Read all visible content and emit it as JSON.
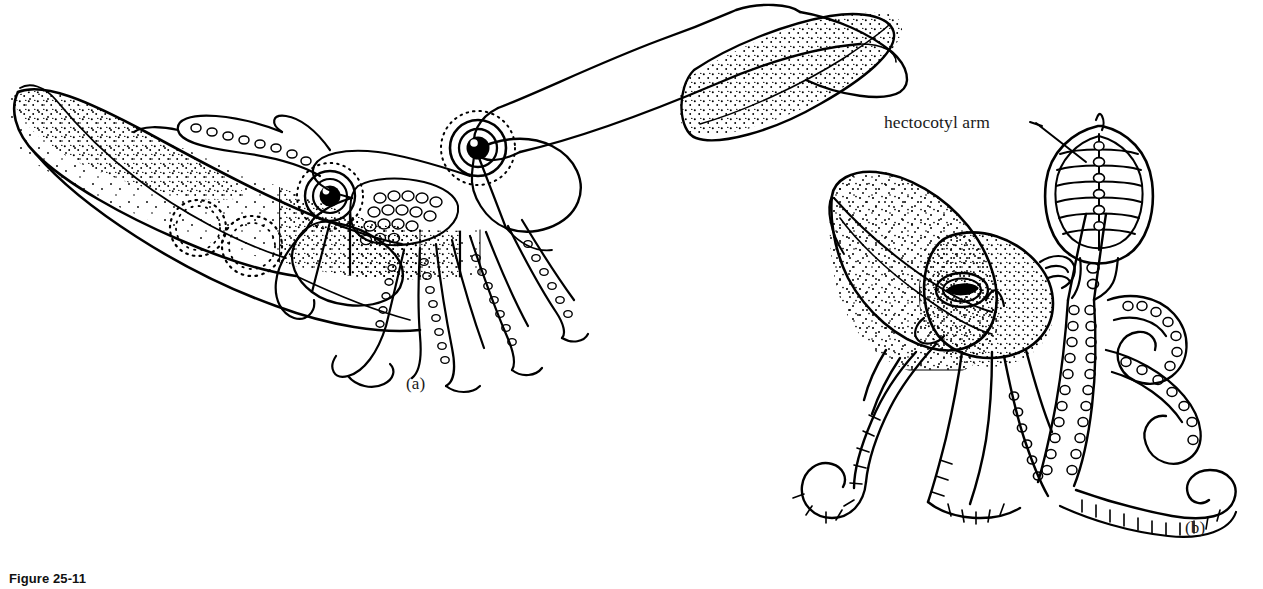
{
  "figure": {
    "caption": "Figure 25-11",
    "panels": [
      {
        "id": "a",
        "label": "(a)",
        "subject": "squid-pair"
      },
      {
        "id": "b",
        "label": "(b)",
        "subject": "octopus"
      }
    ],
    "annotations": [
      {
        "name": "hectocotyl-arm",
        "text": "hectocotyl arm"
      }
    ],
    "colors": {
      "background": "#ffffff",
      "ink": "#000000",
      "text": "#1a1a1a"
    }
  }
}
